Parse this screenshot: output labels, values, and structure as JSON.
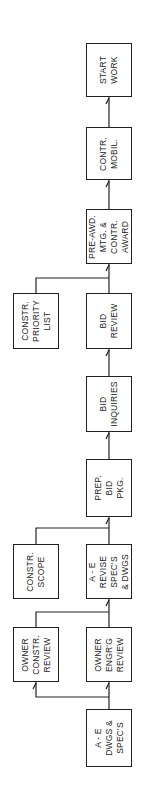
{
  "diagram": {
    "type": "flowchart",
    "orientation": "vertical, read bottom-to-top (labels rotated 90°)",
    "line_color": "#222222",
    "nodes": [
      {
        "id": "start_work",
        "label": "START\nWORK"
      },
      {
        "id": "contr_mobil",
        "label": "CONTR.\nMOBIL."
      },
      {
        "id": "pre_award",
        "label": "PRE-AWD.\nMTG. &\nCONTR.\nAWARD"
      },
      {
        "id": "constr_priority",
        "label": "CONSTR.\nPRIORITY\nLIST"
      },
      {
        "id": "bid_review",
        "label": "BID\nREVIEW"
      },
      {
        "id": "bid_inquiries",
        "label": "BID\nINQUIRIES"
      },
      {
        "id": "prep_bid_pkg",
        "label": "PREP.\nBID\nPKG."
      },
      {
        "id": "constr_scope",
        "label": "CONSTR.\nSCOPE"
      },
      {
        "id": "ae_revise",
        "label": "A - E\nREVISE\nSPEC'S\n& DWGS"
      },
      {
        "id": "owner_constr_review",
        "label": "OWNER\nCONSTR.\nREVIEW"
      },
      {
        "id": "owner_engrg_review",
        "label": "OWNER\nENGR'G\nREVIEW"
      },
      {
        "id": "ae_dwgs_specs",
        "label": "A - E\nDWGS &\nSPEC'S"
      }
    ],
    "edges": [
      {
        "from": "ae_dwgs_specs",
        "to": "owner_engrg_review"
      },
      {
        "from": "ae_dwgs_specs",
        "to": "owner_constr_review"
      },
      {
        "from": "owner_engrg_review",
        "to": "ae_revise"
      },
      {
        "from": "owner_constr_review",
        "to": "ae_revise"
      },
      {
        "from": "ae_revise",
        "to": "prep_bid_pkg"
      },
      {
        "from": "constr_scope",
        "to": "prep_bid_pkg"
      },
      {
        "from": "prep_bid_pkg",
        "to": "bid_inquiries"
      },
      {
        "from": "bid_inquiries",
        "to": "bid_review"
      },
      {
        "from": "bid_review",
        "to": "pre_award"
      },
      {
        "from": "constr_priority",
        "to": "pre_award"
      },
      {
        "from": "pre_award",
        "to": "contr_mobil"
      },
      {
        "from": "contr_mobil",
        "to": "start_work"
      }
    ]
  }
}
